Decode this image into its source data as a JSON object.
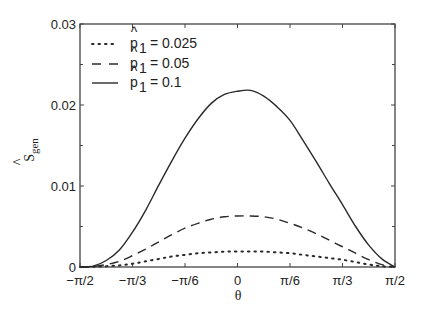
{
  "chart_data": {
    "type": "line",
    "title": "",
    "xlabel": "θ",
    "ylabel": "Ŝ_gen",
    "xlim": [
      -1.5708,
      1.5708
    ],
    "ylim": [
      0,
      0.03
    ],
    "grid": false,
    "legend_position": "upper left",
    "x_ticks": [
      {
        "value": -1.5708,
        "label": "−π/2"
      },
      {
        "value": -1.0472,
        "label": "−π/3"
      },
      {
        "value": -0.5236,
        "label": "−π/6"
      },
      {
        "value": 0,
        "label": "0"
      },
      {
        "value": 0.5236,
        "label": "π/6"
      },
      {
        "value": 1.0472,
        "label": "π/3"
      },
      {
        "value": 1.5708,
        "label": "π/2"
      }
    ],
    "y_ticks": [
      {
        "value": 0,
        "label": "0"
      },
      {
        "value": 0.01,
        "label": "0.01"
      },
      {
        "value": 0.02,
        "label": "0.02"
      },
      {
        "value": 0.03,
        "label": "0.03"
      }
    ],
    "y_minor_ticks": [
      0.005,
      0.015,
      0.025
    ],
    "x": [
      -1.5708,
      -1.4399,
      -1.309,
      -1.1781,
      -1.0472,
      -0.9163,
      -0.7854,
      -0.6545,
      -0.5236,
      -0.3927,
      -0.2618,
      -0.1309,
      0,
      0.1309,
      0.2618,
      0.3927,
      0.5236,
      0.6545,
      0.7854,
      0.9163,
      1.0472,
      1.1781,
      1.309,
      1.4399,
      1.5708
    ],
    "series": [
      {
        "name": "p̂1 = 0.025",
        "legend_label": "= 0.025",
        "style": "dotted",
        "values": [
          0,
          2e-05,
          0.0001,
          0.0002,
          0.0004,
          0.0007,
          0.001,
          0.0013,
          0.0015,
          0.0017,
          0.0018,
          0.0019,
          0.0019,
          0.0019,
          0.0019,
          0.0018,
          0.0017,
          0.0015,
          0.0013,
          0.0011,
          0.0009,
          0.0006,
          0.0003,
          0.0001,
          0
        ]
      },
      {
        "name": "p̂1 = 0.05",
        "legend_label": "= 0.05",
        "style": "dashed",
        "values": [
          0,
          5e-05,
          0.0003,
          0.0007,
          0.0014,
          0.0022,
          0.0031,
          0.004,
          0.0048,
          0.0054,
          0.0059,
          0.0062,
          0.0063,
          0.0063,
          0.0062,
          0.0059,
          0.0054,
          0.0048,
          0.0041,
          0.0033,
          0.0025,
          0.0017,
          0.0009,
          0.0003,
          0
        ]
      },
      {
        "name": "p̂1 = 0.1",
        "legend_label": "= 0.1",
        "style": "solid",
        "values": [
          0,
          0.0001,
          0.0008,
          0.0021,
          0.0043,
          0.007,
          0.0101,
          0.0131,
          0.0159,
          0.0183,
          0.0202,
          0.0213,
          0.0217,
          0.0218,
          0.0211,
          0.0198,
          0.0181,
          0.0156,
          0.013,
          0.0103,
          0.0077,
          0.005,
          0.0027,
          0.001,
          0
        ]
      }
    ]
  },
  "legend": {
    "symbol": "p̂",
    "subscript": "1",
    "items": [
      "= 0.025",
      "= 0.05",
      "= 0.1"
    ]
  },
  "axes": {
    "xlabel": "θ",
    "ylabel_main": "S",
    "ylabel_sub": "gen",
    "ylabel_hat": "^"
  },
  "colors": {
    "line": "#2a2a2a",
    "axis": "#444444",
    "background": "#ffffff"
  }
}
